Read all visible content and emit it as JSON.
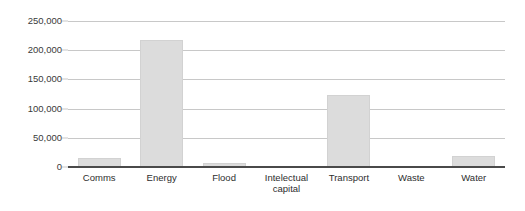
{
  "chart_data": {
    "type": "bar",
    "title": "",
    "subtitle": "",
    "xlabel": "",
    "ylabel": "",
    "categories": [
      "Comms",
      "Energy",
      "Flood",
      "Intelectual capital",
      "Transport",
      "Waste",
      "Water"
    ],
    "values": [
      15000,
      218000,
      7000,
      0,
      123000,
      1000,
      19000
    ],
    "ylim": [
      0,
      250000
    ],
    "yticks": [
      0,
      50000,
      100000,
      150000,
      200000,
      250000
    ],
    "ytick_labels": [
      "0",
      "50,000",
      "100,000",
      "150,000",
      "200,000",
      "250,000"
    ],
    "grid": true,
    "legend": false,
    "legend_position": "none",
    "bar_color": "#dcdcdc",
    "gridline_color": "#c8c8c8",
    "axis_color": "#4a4a4a",
    "background_color": "#ffffff"
  },
  "axis": {
    "y_ticks": [
      {
        "label": "250,000",
        "value": 250000
      },
      {
        "label": "200,000",
        "value": 200000
      },
      {
        "label": "150,000",
        "value": 150000
      },
      {
        "label": "100,000",
        "value": 100000
      },
      {
        "label": "50,000",
        "value": 50000
      },
      {
        "label": "0",
        "value": 0
      }
    ],
    "x_categories": [
      {
        "label": "Comms"
      },
      {
        "label": "Energy"
      },
      {
        "label": "Flood"
      },
      {
        "label": "Intelectual\ncapital"
      },
      {
        "label": "Transport"
      },
      {
        "label": "Waste"
      },
      {
        "label": "Water"
      }
    ]
  }
}
